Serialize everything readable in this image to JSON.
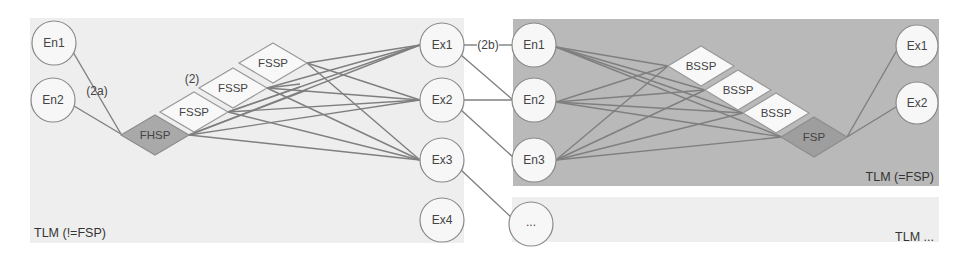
{
  "colors": {
    "left_panel_bg": "#eeeeee",
    "right_panel_bg": "#b9b9b9",
    "bottom_panel_bg": "#eeeeee",
    "edge": "#7f7f7f",
    "node_fill": "#f7f7f7",
    "main_diamond_fill": "#a9a9a9"
  },
  "left_panel": {
    "label": "TLM (!=FSP)",
    "entry_nodes": [
      {
        "id": "en1",
        "label": "En1"
      },
      {
        "id": "en2",
        "label": "En2"
      }
    ],
    "hub": {
      "id": "fhsp",
      "label": "FHSP"
    },
    "sub_processes": [
      {
        "id": "fssp1",
        "label": "FSSP"
      },
      {
        "id": "fssp2",
        "label": "FSSP"
      },
      {
        "id": "fssp3",
        "label": "FSSP"
      }
    ],
    "exit_nodes": [
      {
        "id": "ex1",
        "label": "Ex1"
      },
      {
        "id": "ex2",
        "label": "Ex2"
      },
      {
        "id": "ex3",
        "label": "Ex3"
      },
      {
        "id": "ex4",
        "label": "Ex4"
      }
    ],
    "annotations": {
      "entry_edge": "(2a)",
      "sub_process_group": "(2)"
    }
  },
  "connector": {
    "annotation": "(2b)"
  },
  "right_panel": {
    "label": "TLM (=FSP)",
    "entry_nodes": [
      {
        "id": "en1",
        "label": "En1"
      },
      {
        "id": "en2",
        "label": "En2"
      },
      {
        "id": "en3",
        "label": "En3"
      }
    ],
    "sub_processes": [
      {
        "id": "bssp1",
        "label": "BSSP"
      },
      {
        "id": "bssp2",
        "label": "BSSP"
      },
      {
        "id": "bssp3",
        "label": "BSSP"
      }
    ],
    "hub": {
      "id": "fsp",
      "label": "FSP"
    },
    "exit_nodes": [
      {
        "id": "ex1",
        "label": "Ex1"
      },
      {
        "id": "ex2",
        "label": "Ex2"
      }
    ]
  },
  "bottom_panel": {
    "label": "TLM ...",
    "entry_nodes": [
      {
        "id": "more",
        "label": "..."
      }
    ]
  }
}
